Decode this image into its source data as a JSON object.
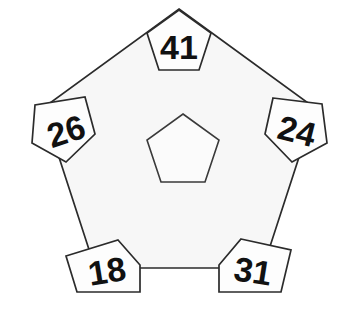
{
  "figure": {
    "type": "geometric-diagram",
    "background_color": "#ffffff",
    "fill_color": "#f7f7f7",
    "stroke_color": "#2b2b2b",
    "text_color": "#111111"
  },
  "outer_pentagon": {
    "name": "outer-pentagon",
    "center": {
      "x": 179,
      "y": 152
    },
    "circumradius": 143,
    "rotation_deg": 0,
    "points": "179,9 315,108 263,268 95,268 43,108",
    "label": ""
  },
  "center_pentagon": {
    "name": "center-pentagon",
    "center": {
      "x": 183,
      "y": 152
    },
    "circumradius": 38,
    "points": "183,114 219,140 205,182 161,182 147,140",
    "label": ""
  },
  "nodes": [
    {
      "id": "node-top",
      "position": "top",
      "value": "41",
      "points": "179,10 211,33 199,70 159,70 147,33",
      "text_x": 179,
      "text_y": 47,
      "rotation_deg": 0
    },
    {
      "id": "node-upper-left",
      "position": "upper-left",
      "value": "26",
      "points": "85,97 95,134 66,162 32,143 35,105",
      "text_x": 66,
      "text_y": 131,
      "rotation_deg": -18
    },
    {
      "id": "node-upper-right",
      "position": "upper-right",
      "value": "24",
      "points": "273,98 322,104 327,143 292,162 265,134",
      "text_x": 297,
      "text_y": 131,
      "rotation_deg": 14
    },
    {
      "id": "node-lower-left",
      "position": "lower-left",
      "value": "18",
      "points": "118,240 140,265 140,292 77,292 66,256",
      "text_x": 107,
      "text_y": 271,
      "rotation_deg": -9
    },
    {
      "id": "node-lower-right",
      "position": "lower-right",
      "value": "31",
      "points": "241,239 291,250 281,292 219,292 219,265",
      "text_x": 253,
      "text_y": 271,
      "rotation_deg": 9
    }
  ]
}
